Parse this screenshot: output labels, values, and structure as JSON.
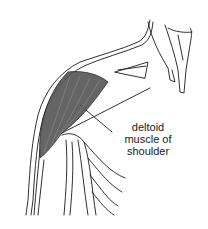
{
  "figure": {
    "label_lines": [
      "deltoid",
      "muscle of",
      "shoulder"
    ],
    "colors": {
      "ink": "#1a1a1a",
      "muscle_fill": "#555555",
      "background": "#ffffff"
    }
  }
}
